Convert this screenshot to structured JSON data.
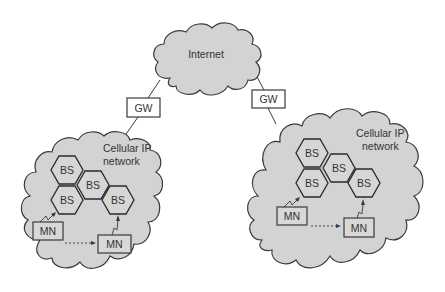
{
  "diagram": {
    "title": "",
    "colors": {
      "cloud_fill": "#d3d3d3",
      "hex_fill": "#d6d6d6",
      "stroke": "#3a3a3a",
      "background": "#ffffff"
    },
    "internet": {
      "label": "Internet"
    },
    "gateways": [
      {
        "id": "gw-left",
        "label": "GW"
      },
      {
        "id": "gw-right",
        "label": "GW"
      }
    ],
    "networks": [
      {
        "id": "left",
        "label_line1": "Cellular IP",
        "label_line2": "network",
        "base_stations": [
          "BS",
          "BS",
          "BS",
          "BS"
        ],
        "mobile_nodes": [
          "MN",
          "MN"
        ]
      },
      {
        "id": "right",
        "label_line1": "Cellular IP",
        "label_line2": "network",
        "base_stations": [
          "BS",
          "BS",
          "BS",
          "BS"
        ],
        "mobile_nodes": [
          "MN",
          "MN"
        ]
      }
    ],
    "edges": [
      {
        "from": "Internet",
        "to": "GW (left)"
      },
      {
        "from": "GW (left)",
        "to": "Cellular IP network (left)"
      },
      {
        "from": "Internet",
        "to": "GW (right)"
      },
      {
        "from": "GW (right)",
        "to": "Cellular IP network (right)"
      },
      {
        "from": "MN",
        "to": "BS",
        "type": "wireless"
      },
      {
        "from": "MN",
        "to": "MN",
        "type": "movement (dashed)"
      }
    ]
  }
}
